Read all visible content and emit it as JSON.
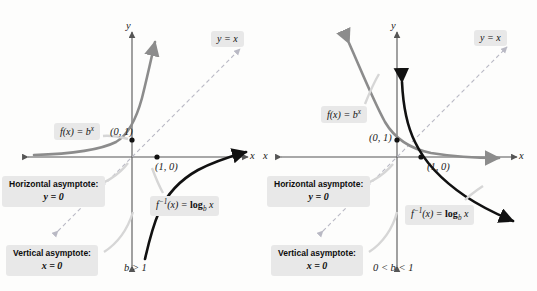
{
  "figure": {
    "colors": {
      "exponential_curve": "#8c8c8c",
      "logarithm_curve": "#111111",
      "identity_line": "#b9b9c4",
      "axis": "#555555",
      "callout_background": "#e8e8e8"
    }
  },
  "panels": [
    {
      "id": "panel-left",
      "base_condition": "b > 1",
      "axis_labels": {
        "x": "x",
        "y": "y"
      },
      "identity_label": "y = x",
      "exponential_label_parts": {
        "f": "f",
        "arg": "(x) = ",
        "base": "b",
        "exponent": "x"
      },
      "inverse_label_parts": {
        "f": "f",
        "inv": "−1",
        "arg": "(x) = ",
        "log": "log",
        "sub": "b",
        "var": "x"
      },
      "points": [
        {
          "name": "y-intercept",
          "label": "(0, 1)"
        },
        {
          "name": "x-intercept",
          "label": "(1, 0)"
        }
      ],
      "horizontal_asymptote": {
        "title": "Horizontal asymptote:",
        "equation": "y = 0"
      },
      "vertical_asymptote": {
        "title": "Vertical asymptote:",
        "equation": "x = 0"
      }
    },
    {
      "id": "panel-right",
      "base_condition": "0 < b < 1",
      "axis_labels": {
        "x": "x",
        "y": "y",
        "x_left": "x"
      },
      "identity_label": "y = x",
      "exponential_label_parts": {
        "f": "f",
        "arg": "(x) = ",
        "base": "b",
        "exponent": "x"
      },
      "inverse_label_parts": {
        "f": "f",
        "inv": "−1",
        "arg": "(x) = ",
        "log": "log",
        "sub": "b",
        "var": "x"
      },
      "points": [
        {
          "name": "y-intercept",
          "label": "(0, 1)"
        },
        {
          "name": "x-intercept",
          "label": "(1, 0)"
        }
      ],
      "horizontal_asymptote": {
        "title": "Horizontal asymptote:",
        "equation": "y = 0"
      },
      "vertical_asymptote": {
        "title": "Vertical asymptote:",
        "equation": "x = 0"
      }
    }
  ]
}
